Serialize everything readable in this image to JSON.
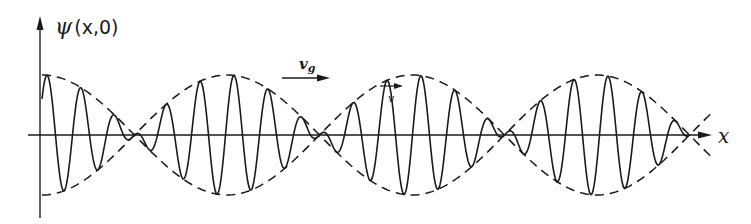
{
  "figure": {
    "y_axis_label": "ψ(x,0)",
    "y_axis_label_psi": "ψ",
    "y_axis_label_args": "(x,0)",
    "x_axis_label": "x",
    "group_velocity_label": "v",
    "group_velocity_subscript": "g",
    "phase_velocity_label": "v",
    "colors": {
      "ink": "#1a1a1a",
      "background": "#ffffff"
    }
  },
  "wave": {
    "description": "Wave packet (beats): carrier oscillation modulated by a |cos| envelope shown dashed",
    "axis_y": 135,
    "amplitude": 60,
    "x_start": 42,
    "x_end": 690,
    "envelope_x_end": 712,
    "envelope_half_period": 185,
    "envelope_phase_x": 42,
    "carrier_period": 34,
    "carrier_phase_x": 47
  }
}
